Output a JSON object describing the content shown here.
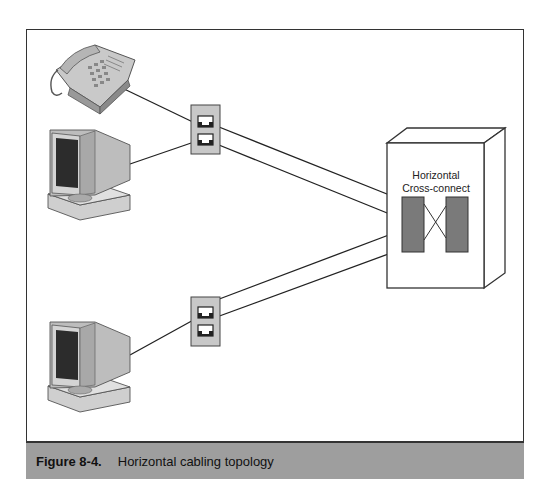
{
  "figure": {
    "number": "Figure 8-4.",
    "title": "Horizontal cabling topology"
  },
  "diagram": {
    "cabinet_label_line1": "Horizontal",
    "cabinet_label_line2": "Cross-connect",
    "nodes": [
      {
        "id": "telephone",
        "type": "telephone-icon"
      },
      {
        "id": "workstation-1",
        "type": "computer-icon"
      },
      {
        "id": "workstation-2",
        "type": "computer-icon"
      },
      {
        "id": "wall-plate-1",
        "type": "wall-outlet",
        "jacks": 2
      },
      {
        "id": "wall-plate-2",
        "type": "wall-outlet",
        "jacks": 2
      },
      {
        "id": "telecom-closet",
        "type": "cabinet",
        "label": "Horizontal Cross-connect"
      }
    ],
    "colors": {
      "caption_bg": "#9e9e9e",
      "patch_block": "#7a7a7a",
      "wall_plate": "#c8c8c8",
      "line": "#222222"
    }
  }
}
